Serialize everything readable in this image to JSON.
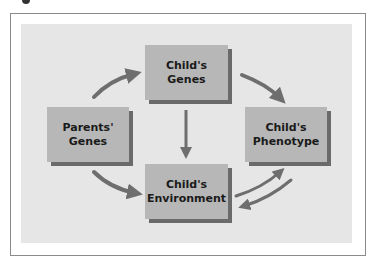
{
  "diagram": {
    "type": "flow",
    "colors": {
      "panel": "#e6e6e6",
      "box": "#b7b7b7",
      "box_shadow": "#6a6a6a",
      "arrow": "#6e6e6e",
      "frame": "#8a8a8a"
    },
    "nodes": [
      {
        "id": "childs-genes",
        "line1": "Child's",
        "line2": "Genes"
      },
      {
        "id": "parents-genes",
        "line1": "Parents'",
        "line2": "Genes"
      },
      {
        "id": "childs-phenotype",
        "line1": "Child's",
        "line2": "Phenotype"
      },
      {
        "id": "childs-environment",
        "line1": "Child's",
        "line2": "Environment"
      }
    ],
    "edges": [
      {
        "from": "Parents' Genes",
        "to": "Child's Genes"
      },
      {
        "from": "Parents' Genes",
        "to": "Child's Environment"
      },
      {
        "from": "Child's Genes",
        "to": "Child's Phenotype"
      },
      {
        "from": "Child's Genes",
        "to": "Child's Environment"
      },
      {
        "from": "Child's Environment",
        "to": "Child's Phenotype"
      },
      {
        "from": "Child's Phenotype",
        "to": "Child's Environment"
      }
    ]
  }
}
